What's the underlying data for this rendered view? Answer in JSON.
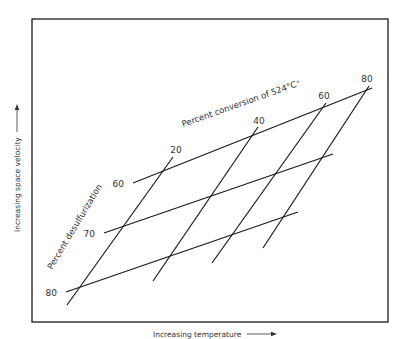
{
  "diagram": {
    "frame": {
      "x1": 32,
      "y1": 19,
      "x2": 388,
      "y2": 322
    },
    "x_axis_label": "Increasing temperature",
    "y_axis_label": "Increasing space velocity",
    "conversion_title": "Percent conversion of 524°C⁺",
    "desulfurization_title": "Percent desulfurization",
    "conversion_lines": [
      {
        "label": "20",
        "x1": 173,
        "y1": 157,
        "x2": 67,
        "y2": 305,
        "lx": 176,
        "ly": 153
      },
      {
        "label": "40",
        "x1": 258,
        "y1": 127,
        "x2": 153,
        "y2": 281,
        "lx": 259,
        "ly": 124
      },
      {
        "label": "60",
        "x1": 326,
        "y1": 103,
        "x2": 212,
        "y2": 263,
        "lx": 324,
        "ly": 99
      },
      {
        "label": "80",
        "x1": 369,
        "y1": 86,
        "x2": 263,
        "y2": 248,
        "lx": 367,
        "ly": 82
      }
    ],
    "desulfurization_lines": [
      {
        "label": "60",
        "x1": 133,
        "y1": 183,
        "x2": 372,
        "y2": 88,
        "lx": 124,
        "ly": 187
      },
      {
        "label": "70",
        "x1": 104,
        "y1": 233,
        "x2": 333,
        "y2": 154,
        "lx": 95,
        "ly": 237
      },
      {
        "label": "80",
        "x1": 66,
        "y1": 292,
        "x2": 298,
        "y2": 212,
        "lx": 57,
        "ly": 296
      }
    ],
    "stroke_color": "#1a1a1a",
    "text_color": "#333333"
  }
}
